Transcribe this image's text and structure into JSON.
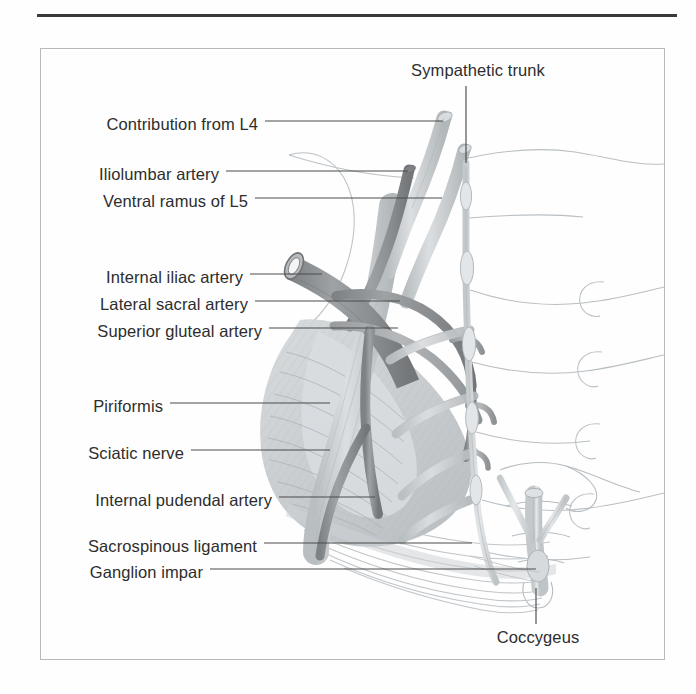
{
  "figure": {
    "kind": "anatomical-illustration",
    "title_rule": true,
    "region": "Pelvic wall: internal iliac artery branches, sacral plexus and sympathetic trunk",
    "frame": {
      "border_color": "#b9b9b9",
      "background": "#fefefe"
    },
    "palette": {
      "ink": "#2d2d2d",
      "leader": "#4a4a4a",
      "artery_dark": "#8e9092",
      "artery_mid": "#a8abad",
      "nerve_light": "#c9cdd0",
      "muscle_fill": "#cfd3d6",
      "muscle_shade": "#bcc1c5",
      "bone_outline": "#b6bcc0",
      "ligament": "#c4c9cd",
      "frame": "#b9b9b9",
      "rule": "#3a3a3a"
    }
  },
  "labels": {
    "left": [
      {
        "id": "contribution-from-l4",
        "text": "Contribution from L4",
        "x": 258,
        "y": 127,
        "leader_to_x": 443,
        "leader_to_y": 120
      },
      {
        "id": "iliolumbar-artery",
        "text": "Iliolumbar artery",
        "x": 219,
        "y": 176,
        "leader_to_x": 408,
        "leader_to_y": 172
      },
      {
        "id": "ventral-ramus-of-l5",
        "text": "Ventral ramus of L5",
        "x": 248,
        "y": 204,
        "leader_to_x": 442,
        "leader_to_y": 198
      },
      {
        "id": "internal-iliac-artery",
        "text": "Internal iliac artery",
        "x": 243,
        "y": 279,
        "leader_to_x": 320,
        "leader_to_y": 278
      },
      {
        "id": "lateral-sacral-artery",
        "text": "Lateral sacral artery",
        "x": 248,
        "y": 306,
        "leader_to_x": 400,
        "leader_to_y": 302
      },
      {
        "id": "superior-gluteal-artery",
        "text": "Superior gluteal artery",
        "x": 262,
        "y": 333,
        "leader_to_x": 398,
        "leader_to_y": 330
      },
      {
        "id": "piriformis",
        "text": "Piriformis",
        "x": 163,
        "y": 408,
        "leader_to_x": 330,
        "leader_to_y": 404
      },
      {
        "id": "sciatic-nerve",
        "text": "Sciatic nerve",
        "x": 184,
        "y": 455,
        "leader_to_x": 330,
        "leader_to_y": 452
      },
      {
        "id": "internal-pudendal-artery",
        "text": "Internal pudendal artery",
        "x": 272,
        "y": 502,
        "leader_to_x": 375,
        "leader_to_y": 498
      },
      {
        "id": "sacrospinous-ligament",
        "text": "Sacrospinous ligament",
        "x": 257,
        "y": 548,
        "leader_to_x": 470,
        "leader_to_y": 535
      },
      {
        "id": "ganglion-impar",
        "text": "Ganglion impar",
        "x": 203,
        "y": 574,
        "leader_to_x": 536,
        "leader_to_y": 568
      }
    ],
    "top": [
      {
        "id": "sympathetic-trunk",
        "text": "Sympathetic trunk",
        "x": 478,
        "y": 77,
        "leader_x": 466,
        "leader_from_y": 86,
        "leader_to_y": 163
      }
    ],
    "bottom": [
      {
        "id": "coccygeus",
        "text": "Coccygeus",
        "x": 538,
        "y": 641,
        "leader_x": 536,
        "leader_from_y": 586,
        "leader_to_y": 624
      }
    ]
  }
}
